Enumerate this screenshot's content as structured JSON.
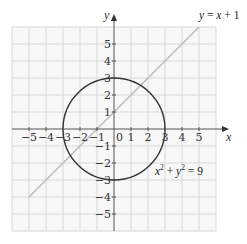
{
  "diagram": {
    "type": "coordinate-plane",
    "grid": {
      "x_min": -6,
      "x_max": 6,
      "y_min": -6,
      "y_max": 6,
      "step": 1
    },
    "axes": {
      "x_label": "x",
      "y_label": "y",
      "origin_label": "0"
    },
    "x_ticks": [
      "−5",
      "−4",
      "−3",
      "−2",
      "−1",
      "1",
      "2",
      "3",
      "4",
      "5"
    ],
    "y_ticks": [
      "5",
      "4",
      "3",
      "2",
      "1",
      "−1",
      "−2",
      "−3",
      "−4",
      "−5"
    ],
    "curves": [
      {
        "name": "circle",
        "equation": "x² + y² = 9",
        "center": [
          0,
          0
        ],
        "radius": 3,
        "color": "#333333"
      },
      {
        "name": "line",
        "equation": "y = x + 1",
        "slope": 1,
        "intercept": 1,
        "color": "#bdbdbd"
      }
    ],
    "labels": {
      "line_label_parts": [
        "y",
        " = ",
        "x",
        " + 1"
      ],
      "circle_label_parts": [
        "x",
        "2",
        " + ",
        "y",
        "2",
        " = 9"
      ]
    },
    "colors": {
      "grid": "#d9d9d9",
      "grid_bg": "#f7f7f7",
      "axis": "#555555",
      "circle": "#333333",
      "line": "#bdbdbd"
    }
  }
}
